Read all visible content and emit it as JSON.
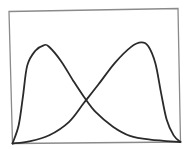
{
  "chart_data": {
    "type": "line",
    "title": "",
    "xlabel": "",
    "ylabel": "",
    "grid": false,
    "legend": "none",
    "xlim": [
      0,
      1
    ],
    "ylim": [
      0,
      1
    ],
    "colors": {
      "frame": "#8a8a8a",
      "curve": "#2a2a2a"
    },
    "series": [
      {
        "name": "positively-skewed-distribution",
        "points": [
          [
            0.0,
            0.0
          ],
          [
            0.04,
            0.14
          ],
          [
            0.07,
            0.36
          ],
          [
            0.1,
            0.59
          ],
          [
            0.15,
            0.7
          ],
          [
            0.2,
            0.74
          ],
          [
            0.23,
            0.73
          ],
          [
            0.3,
            0.62
          ],
          [
            0.37,
            0.47
          ],
          [
            0.43,
            0.35
          ],
          [
            0.5,
            0.23
          ],
          [
            0.6,
            0.12
          ],
          [
            0.7,
            0.05
          ],
          [
            0.82,
            0.02
          ],
          [
            1.0,
            0.0
          ]
        ]
      },
      {
        "name": "negatively-skewed-distribution",
        "points": [
          [
            0.0,
            0.0
          ],
          [
            0.1,
            0.015
          ],
          [
            0.22,
            0.06
          ],
          [
            0.34,
            0.16
          ],
          [
            0.43,
            0.3
          ],
          [
            0.52,
            0.44
          ],
          [
            0.62,
            0.6
          ],
          [
            0.72,
            0.72
          ],
          [
            0.78,
            0.75
          ],
          [
            0.82,
            0.72
          ],
          [
            0.86,
            0.59
          ],
          [
            0.89,
            0.37
          ],
          [
            0.92,
            0.17
          ],
          [
            0.96,
            0.05
          ],
          [
            1.0,
            0.0
          ]
        ]
      }
    ]
  }
}
